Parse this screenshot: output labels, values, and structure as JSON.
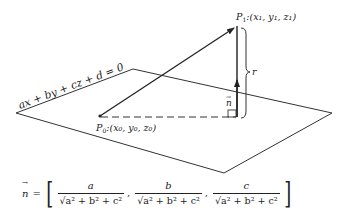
{
  "diagram": {
    "plane_equation": "ax + by + cz + d = 0",
    "point_p0": {
      "name": "P",
      "subscript": "0",
      "coords": ":(x₀, y₀, z₀)"
    },
    "point_p1": {
      "name": "P",
      "subscript": "1",
      "coords": ":(x₁, y₁, z₁)"
    },
    "normal_label": "n",
    "distance_label": "r",
    "formula": {
      "lhs": "n",
      "equals": "=",
      "open_bracket": "[",
      "close_bracket": "]",
      "components": [
        {
          "numerator": "a",
          "denominator": "√a² + b² + c²"
        },
        {
          "numerator": "b",
          "denominator": "√a² + b² + c²"
        },
        {
          "numerator": "c",
          "denominator": "√a² + b² + c²"
        }
      ],
      "separator": ","
    },
    "colors": {
      "ink": "#222222",
      "background": "#ffffff"
    }
  }
}
